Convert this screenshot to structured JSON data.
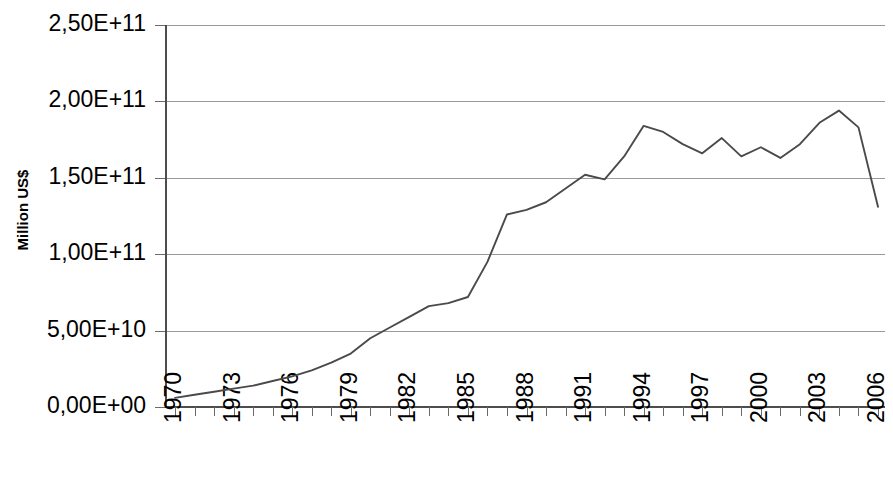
{
  "chart_data": {
    "type": "line",
    "title": "",
    "xlabel": "",
    "ylabel": "Million US$",
    "xlim": [
      1970,
      2006
    ],
    "ylim": [
      0,
      250000000000
    ],
    "grid": true,
    "legend": "none",
    "y_tick_labels": [
      "2,50E+11",
      "2,00E+11",
      "1,50E+11",
      "1,00E+11",
      "5,00E+10",
      "0,00E+00"
    ],
    "y_tick_values": [
      250000000000,
      200000000000,
      150000000000,
      100000000000,
      50000000000,
      0
    ],
    "x_tick_labels": [
      "1970",
      "1973",
      "1976",
      "1979",
      "1982",
      "1985",
      "1988",
      "1991",
      "1994",
      "1997",
      "2000",
      "2003",
      "2006"
    ],
    "x_tick_label_interval": 3,
    "x_minor_tick_interval": 1,
    "x": [
      1970,
      1971,
      1972,
      1973,
      1974,
      1975,
      1976,
      1977,
      1978,
      1979,
      1980,
      1981,
      1982,
      1983,
      1984,
      1985,
      1986,
      1987,
      1988,
      1989,
      1990,
      1991,
      1992,
      1993,
      1994,
      1995,
      1996,
      1997,
      1998,
      1999,
      2000,
      2001,
      2002,
      2003,
      2004,
      2005,
      2006
    ],
    "series": [
      {
        "name": "Million US$",
        "values": [
          6000000000,
          8000000000,
          10000000000,
          12000000000,
          14000000000,
          17000000000,
          20000000000,
          24000000000,
          29000000000,
          35000000000,
          45000000000,
          52000000000,
          59000000000,
          66000000000,
          68000000000,
          72000000000,
          95000000000,
          126000000000,
          129000000000,
          134000000000,
          143000000000,
          152000000000,
          149000000000,
          164000000000,
          184000000000,
          180000000000,
          172000000000,
          166000000000,
          176000000000,
          164000000000,
          170000000000,
          163000000000,
          172000000000,
          186000000000,
          194000000000,
          183000000000,
          131000000000
        ]
      }
    ],
    "line_color": "#4a4a4a",
    "grid_color": "#9a9a9a",
    "axis_color": "#4d4d4d",
    "background_color": "#ffffff"
  },
  "layout": {
    "plot_left": 166,
    "plot_right": 885,
    "plot_top": 25,
    "plot_bottom": 407
  }
}
